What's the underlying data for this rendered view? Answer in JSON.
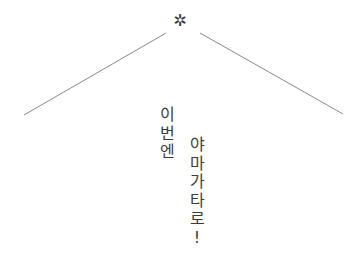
{
  "header": {
    "ornament": "✲"
  },
  "lines": {
    "color": "#8a8a8a",
    "left": {
      "x1": 24,
      "y1": 115,
      "x2": 166,
      "y2": 33
    },
    "right": {
      "x1": 200,
      "y1": 33,
      "x2": 343,
      "y2": 114
    }
  },
  "text": {
    "column_left": [
      "이",
      "번",
      "엔"
    ],
    "column_right": [
      "야",
      "마",
      "가",
      "타",
      "로",
      "!"
    ],
    "color": "#3c3c3c"
  }
}
